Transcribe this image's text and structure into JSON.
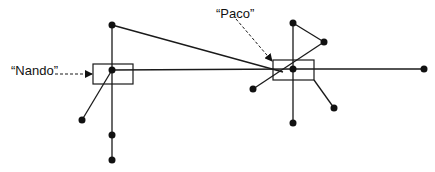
{
  "diagram": {
    "type": "network-graph",
    "labels": {
      "nando": "“Nando”",
      "paco": "“Paco”"
    },
    "colors": {
      "ink": "#111111",
      "background": "#ffffff"
    },
    "highlighted_nodes": [
      {
        "id": "nando",
        "label": "“Nando”",
        "x": 112,
        "y": 70
      },
      {
        "id": "paco",
        "label": "“Paco”",
        "x": 293,
        "y": 69
      }
    ],
    "nodes": [
      {
        "id": "n_top",
        "x": 112,
        "y": 25
      },
      {
        "id": "nando",
        "x": 112,
        "y": 70
      },
      {
        "id": "n_ll",
        "x": 82,
        "y": 120
      },
      {
        "id": "n_b1",
        "x": 112,
        "y": 135
      },
      {
        "id": "n_b2",
        "x": 112,
        "y": 160
      },
      {
        "id": "paco",
        "x": 293,
        "y": 69
      },
      {
        "id": "p_top",
        "x": 293,
        "y": 23
      },
      {
        "id": "p_ur",
        "x": 324,
        "y": 42
      },
      {
        "id": "p_l",
        "x": 253,
        "y": 89
      },
      {
        "id": "p_lr",
        "x": 334,
        "y": 108
      },
      {
        "id": "p_b",
        "x": 293,
        "y": 123
      },
      {
        "id": "far_right",
        "x": 424,
        "y": 69
      }
    ],
    "edges": [
      [
        "n_top",
        "nando"
      ],
      [
        "nando",
        "n_b1"
      ],
      [
        "n_b1",
        "n_b2"
      ],
      [
        "nando",
        "n_ll"
      ],
      [
        "nando",
        "paco"
      ],
      [
        "n_top",
        "paco"
      ],
      [
        "paco",
        "far_right"
      ],
      [
        "paco",
        "p_top"
      ],
      [
        "p_top",
        "p_ur"
      ],
      [
        "p_ur",
        "p_l"
      ],
      [
        "paco",
        "p_b"
      ],
      [
        "paco",
        "p_lr"
      ]
    ]
  }
}
